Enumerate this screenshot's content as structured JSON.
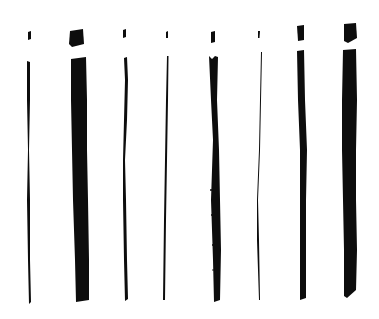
{
  "image": {
    "description": "Eight hand-drawn ink letter 'i' strokes of varying widths",
    "background": "#ffffff",
    "ink_color": "#0d0d0d",
    "strokes": [
      {
        "index": 1,
        "dot": [
          27,
          31,
          5,
          9
        ],
        "stem": [
          27,
          61,
          5,
          243
        ],
        "style": "thin"
      },
      {
        "index": 2,
        "dot": [
          69,
          29,
          16,
          18
        ],
        "stem": [
          71,
          57,
          17,
          245
        ],
        "style": "broad"
      },
      {
        "index": 3,
        "dot": [
          122,
          29,
          5,
          9
        ],
        "stem": [
          123,
          57,
          5,
          244
        ],
        "style": "thin"
      },
      {
        "index": 4,
        "dot": [
          166,
          31,
          3,
          7
        ],
        "stem": [
          164,
          56,
          3,
          244
        ],
        "style": "hairline"
      },
      {
        "index": 5,
        "dot": [
          210,
          31,
          6,
          12
        ],
        "stem": [
          209,
          56,
          11,
          246
        ],
        "style": "rough dry-brush"
      },
      {
        "index": 6,
        "dot": [
          258,
          31,
          2,
          7
        ],
        "stem": [
          258,
          52,
          3,
          248
        ],
        "style": "hairline"
      },
      {
        "index": 7,
        "dot": [
          297,
          25,
          8,
          16
        ],
        "stem": [
          297,
          50,
          10,
          250
        ],
        "style": "medium"
      },
      {
        "index": 8,
        "dot": [
          343,
          23,
          14,
          20
        ],
        "stem": [
          342,
          49,
          15,
          249
        ],
        "style": "broad chisel"
      }
    ]
  }
}
